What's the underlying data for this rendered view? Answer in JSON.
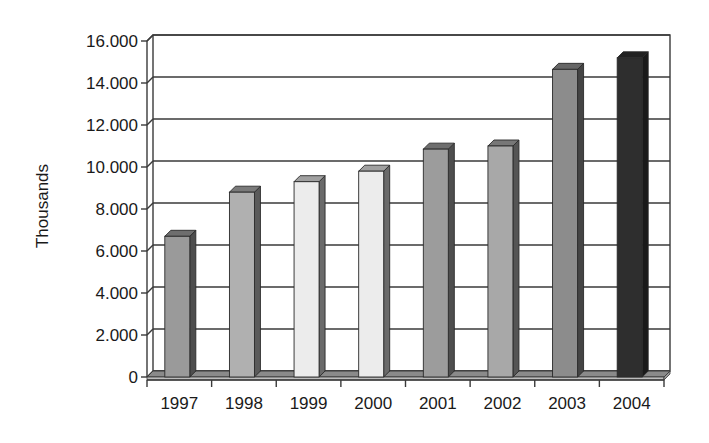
{
  "chart_data": {
    "type": "bar",
    "style": "3d-column",
    "title": "",
    "xlabel": "",
    "ylabel": "Thousands",
    "categories": [
      "1997",
      "1998",
      "1999",
      "2000",
      "2001",
      "2002",
      "2003",
      "2004"
    ],
    "values": [
      6700,
      8800,
      9300,
      9800,
      10850,
      11000,
      14650,
      15200
    ],
    "ylim": [
      0,
      16000
    ],
    "y_ticks": [
      0,
      2000,
      4000,
      6000,
      8000,
      10000,
      12000,
      14000,
      16000
    ],
    "y_tick_labels": [
      "0",
      "2.000",
      "4.000",
      "6.000",
      "8.000",
      "10.000",
      "12.000",
      "14.000",
      "16.000"
    ],
    "grid": true,
    "legend": null,
    "bar_colors": [
      "#9a9a9a",
      "#b0b0b0",
      "#ececec",
      "#ececec",
      "#9c9c9c",
      "#a8a8a8",
      "#8c8c8c",
      "#2e2e2e"
    ],
    "side_colors": [
      "#4e4e4e",
      "#5a5a5a",
      "#6a6a6a",
      "#6a6a6a",
      "#4e4e4e",
      "#555555",
      "#444444",
      "#1a1a1a"
    ],
    "top_colors": [
      "#6e6e6e",
      "#7a7a7a",
      "#a0a0a0",
      "#a0a0a0",
      "#6e6e6e",
      "#777777",
      "#666666",
      "#222222"
    ]
  }
}
